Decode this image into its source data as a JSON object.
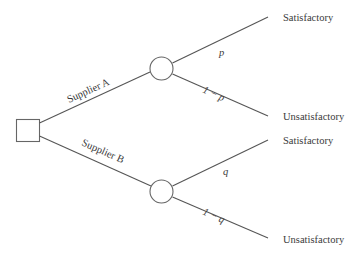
{
  "diagram": {
    "type": "decision-tree",
    "decision_node": {
      "shape": "square",
      "label": ""
    },
    "branches": [
      {
        "label": "Supplier A",
        "chance_node": {
          "shape": "circle"
        },
        "outcomes": [
          {
            "probability": "p",
            "label": "Satisfactory"
          },
          {
            "probability": "1 − p",
            "label": "Unsatisfactory"
          }
        ]
      },
      {
        "label": "Supplier B",
        "chance_node": {
          "shape": "circle"
        },
        "outcomes": [
          {
            "probability": "q",
            "label": "Satisfactory"
          },
          {
            "probability": "1 − q",
            "label": "Unsatisfactory"
          }
        ]
      }
    ],
    "colors": {
      "line": "#555555",
      "text": "#3a3a3a",
      "background": "#ffffff"
    }
  }
}
